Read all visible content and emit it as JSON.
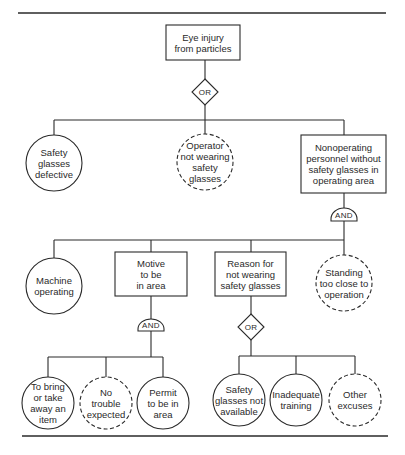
{
  "diagram": {
    "type": "fault-tree",
    "top_event": {
      "id": "top",
      "text": "Eye injury\nfrom particles",
      "shape": "rect"
    },
    "gates": [
      {
        "id": "g1",
        "type": "OR",
        "label": "OR",
        "parent": "top"
      },
      {
        "id": "g2",
        "type": "AND",
        "label": "AND",
        "parent": "n3"
      },
      {
        "id": "g3",
        "type": "AND",
        "label": "AND",
        "parent": "n5"
      },
      {
        "id": "g4",
        "type": "OR",
        "label": "OR",
        "parent": "n6"
      }
    ],
    "nodes": [
      {
        "id": "n1",
        "text": "Safety\nglasses\ndefective",
        "shape": "circle",
        "style": "solid",
        "gate": "g1"
      },
      {
        "id": "n2",
        "text": "Operator\nnot wearing\nsafety\nglasses",
        "shape": "circle",
        "style": "dashed",
        "gate": "g1"
      },
      {
        "id": "n3",
        "text": "Nonoperating\npersonnel without\nsafety glasses in\noperating area",
        "shape": "rect",
        "gate": "g1"
      },
      {
        "id": "n4",
        "text": "Machine\noperating",
        "shape": "circle",
        "style": "solid",
        "gate": "g2"
      },
      {
        "id": "n5",
        "text": "Motive\nto be\nin area",
        "shape": "rect",
        "gate": "g2"
      },
      {
        "id": "n6",
        "text": "Reason for\nnot wearing\nsafety glasses",
        "shape": "rect",
        "gate": "g2"
      },
      {
        "id": "n7",
        "text": "Standing\ntoo close to\noperation",
        "shape": "circle",
        "style": "dashed",
        "gate": "g2"
      },
      {
        "id": "n8",
        "text": "To bring\nor take\naway an\nitem",
        "shape": "circle",
        "style": "solid",
        "gate": "g3"
      },
      {
        "id": "n9",
        "text": "No\ntrouble\nexpected",
        "shape": "circle",
        "style": "dashed",
        "gate": "g3"
      },
      {
        "id": "n10",
        "text": "Permit\nto be in\narea",
        "shape": "circle",
        "style": "solid",
        "gate": "g3"
      },
      {
        "id": "n11",
        "text": "Safety\nglasses not\navailable",
        "shape": "circle",
        "style": "solid",
        "gate": "g4"
      },
      {
        "id": "n12",
        "text": "Inadequate\ntraining",
        "shape": "circle",
        "style": "solid",
        "gate": "g4"
      },
      {
        "id": "n13",
        "text": "Other\nexcuses",
        "shape": "circle",
        "style": "dashed",
        "gate": "g4"
      }
    ]
  },
  "colors": {
    "line": "#2a2a2a",
    "background": "#ffffff"
  }
}
